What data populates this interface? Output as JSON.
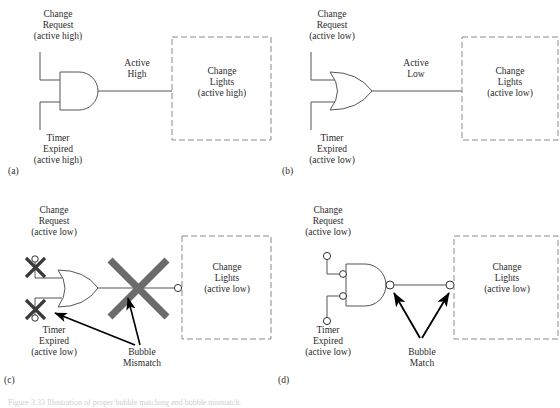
{
  "figure": {
    "caption": "Figure 3.33 Illustration of proper bubble matching and bubble mismatch.",
    "colors": {
      "line": "#555555",
      "dashed_box": "#8a8a8a",
      "text": "#2b2b2b",
      "cross_mark": "#6b6b6b",
      "arrow": "#000000"
    },
    "panels": [
      {
        "id": "(a)",
        "gate": "AND",
        "input_top": "Change\nRequest\n(active high)",
        "input_top_lines": [
          "Change",
          "Request",
          "(active high)"
        ],
        "input_bottom_lines": [
          "Timer",
          "Expired",
          "(active high)"
        ],
        "signal_lines": [
          "Active",
          "High"
        ],
        "load_lines": [
          "Change",
          "Lights",
          "(active high)"
        ],
        "input_bubbles": false,
        "output_bubble": false,
        "load_bubble": false,
        "annotation": null
      },
      {
        "id": "(b)",
        "gate": "OR",
        "input_top_lines": [
          "Change",
          "Request",
          "(active low)"
        ],
        "input_bottom_lines": [
          "Timer",
          "Expired",
          "(active low)"
        ],
        "signal_lines": [
          "Active",
          "Low"
        ],
        "load_lines": [
          "Change",
          "Lights",
          "(active low)"
        ],
        "input_bubbles": false,
        "output_bubble": false,
        "load_bubble": false,
        "annotation": null
      },
      {
        "id": "(c)",
        "gate": "OR",
        "input_top_lines": [
          "Change",
          "Request",
          "(active low)"
        ],
        "input_bottom_lines": [
          "Timer",
          "Expired",
          "(active low)"
        ],
        "signal_lines": [],
        "load_lines": [
          "Change",
          "Lights",
          "(active low)"
        ],
        "input_bubbles": true,
        "output_bubble": false,
        "load_bubble": true,
        "annotation_lines": [
          "Bubble",
          "Mismatch"
        ],
        "cross_marks": 3
      },
      {
        "id": "(d)",
        "gate": "NAND",
        "input_top_lines": [
          "Change",
          "Request",
          "(active low)"
        ],
        "input_bottom_lines": [
          "Timer",
          "Expired",
          "(active low)"
        ],
        "signal_lines": [],
        "load_lines": [
          "Change",
          "Lights",
          "(active low)"
        ],
        "input_bubbles": true,
        "output_bubble": true,
        "load_bubble": true,
        "annotation_lines": [
          "Bubble",
          "Match"
        ],
        "cross_marks": 0
      }
    ]
  }
}
